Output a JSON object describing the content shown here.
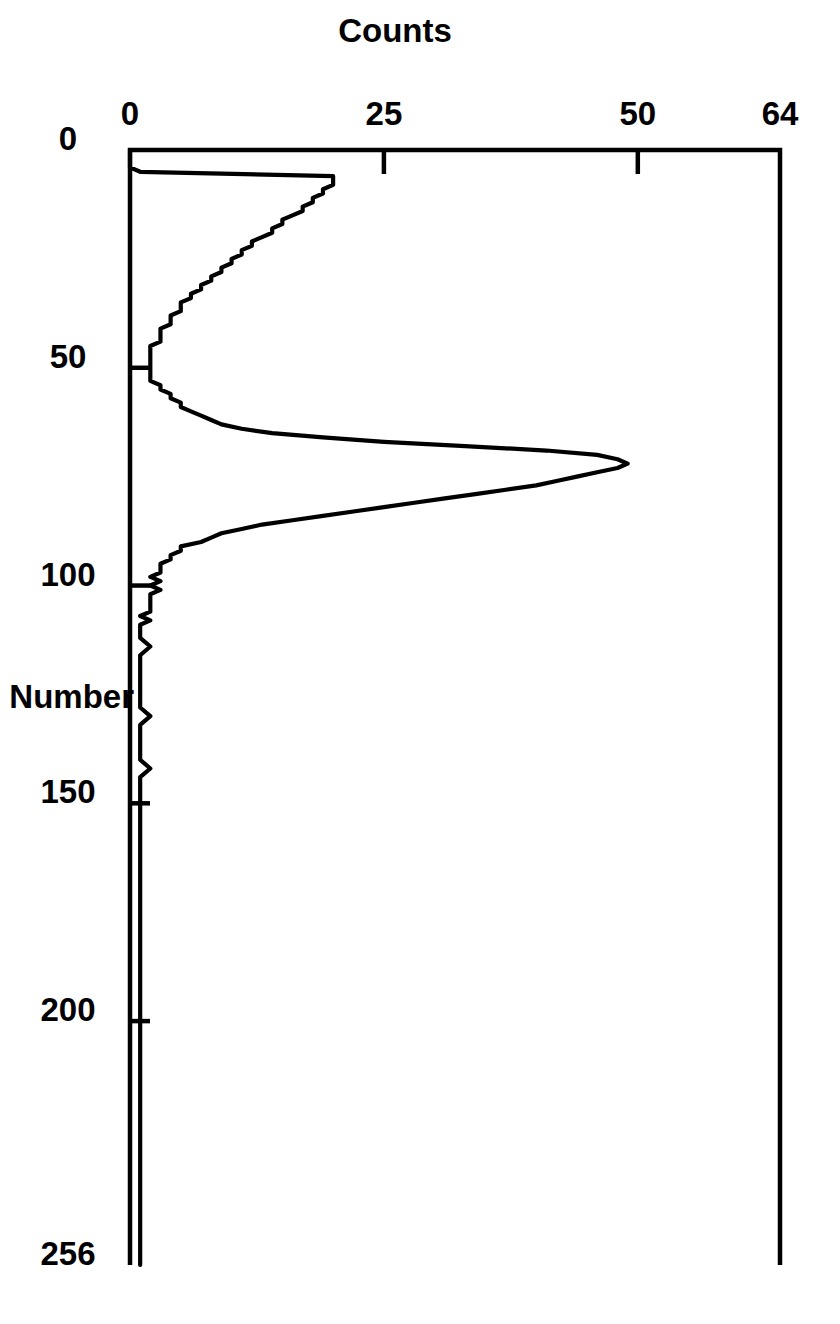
{
  "figure": {
    "orientation": "rotated-90-clockwise",
    "background_color": "#ffffff",
    "line_color": "#000000"
  },
  "chart_data": {
    "type": "line",
    "title": "",
    "subtitle": "",
    "xlabel": "Channel Number",
    "ylabel": "Counts",
    "xlim": [
      0,
      256
    ],
    "ylim": [
      0,
      64
    ],
    "xticks": [
      0,
      50,
      100,
      150,
      200,
      256
    ],
    "xticklabels": [
      "0",
      "50",
      "100",
      "150",
      "200",
      "256"
    ],
    "yticks": [
      0,
      25,
      50,
      64
    ],
    "yticklabels": [
      "0",
      "25",
      "50",
      "64"
    ],
    "grid": false,
    "legend": false,
    "legend_position": "none",
    "annotations": [],
    "series": [
      {
        "name": "spectrum",
        "color": "#000000",
        "x": [
          0,
          1,
          2,
          3,
          4,
          5,
          6,
          7,
          8,
          9,
          10,
          11,
          12,
          13,
          14,
          15,
          16,
          17,
          18,
          19,
          20,
          21,
          22,
          23,
          24,
          25,
          26,
          27,
          28,
          29,
          30,
          31,
          32,
          33,
          34,
          35,
          36,
          37,
          38,
          39,
          40,
          41,
          42,
          43,
          44,
          45,
          46,
          47,
          48,
          49,
          50,
          51,
          52,
          53,
          54,
          55,
          56,
          57,
          58,
          59,
          60,
          61,
          62,
          63,
          64,
          65,
          66,
          67,
          68,
          69,
          70,
          71,
          72,
          73,
          74,
          75,
          76,
          77,
          78,
          79,
          80,
          81,
          82,
          83,
          84,
          85,
          86,
          87,
          88,
          89,
          90,
          91,
          92,
          93,
          94,
          95,
          96,
          97,
          98,
          99,
          100,
          101,
          102,
          103,
          104,
          105,
          106,
          107,
          108,
          109,
          110,
          112,
          114,
          116,
          118,
          120,
          122,
          124,
          126,
          128,
          130,
          132,
          134,
          136,
          138,
          140,
          142,
          144,
          146,
          148,
          150,
          155,
          160,
          165,
          170,
          175,
          180,
          185,
          190,
          195,
          200,
          205,
          210,
          215,
          220,
          225,
          230,
          235,
          240,
          245,
          250,
          256
        ],
        "y": [
          0,
          0,
          0,
          0,
          0,
          1,
          20,
          20,
          20,
          19,
          19,
          18,
          18,
          17,
          17,
          16,
          15,
          15,
          14,
          14,
          13,
          12,
          12,
          11,
          11,
          10,
          10,
          9,
          9,
          8,
          8,
          7,
          7,
          6,
          6,
          5,
          5,
          5,
          4,
          4,
          4,
          3,
          3,
          3,
          3,
          2,
          2,
          2,
          2,
          2,
          2,
          2,
          2,
          2,
          3,
          3,
          4,
          4,
          5,
          5,
          6,
          7,
          8,
          9,
          11,
          14,
          19,
          25,
          33,
          41,
          46,
          48,
          49,
          48,
          46,
          44,
          42,
          40,
          37,
          34,
          31,
          28,
          25,
          22,
          19,
          16,
          13,
          11,
          9,
          8,
          7,
          5,
          5,
          4,
          4,
          3,
          3,
          3,
          2,
          3,
          2,
          3,
          2,
          2,
          2,
          2,
          2,
          1,
          2,
          1,
          1,
          1,
          2,
          1,
          1,
          1,
          1,
          1,
          1,
          1,
          2,
          1,
          1,
          1,
          1,
          1,
          2,
          1,
          1,
          1,
          1,
          1,
          1,
          1,
          1,
          1,
          1,
          1,
          1,
          1,
          1,
          1,
          1,
          1,
          1,
          1,
          1,
          1,
          1,
          1,
          1,
          1
        ],
        "peak_channel": 72,
        "peak_counts": 49,
        "secondary_bump_channel_range": [
          6,
          30
        ],
        "secondary_bump_max_counts": 20
      }
    ]
  },
  "axes": {
    "x": {
      "label": "Channel Number",
      "tick_labels": [
        "0",
        "50",
        "100",
        "150",
        "200",
        "256"
      ]
    },
    "y": {
      "label": "Counts",
      "tick_labels": [
        "0",
        "25",
        "50",
        "64"
      ]
    }
  }
}
